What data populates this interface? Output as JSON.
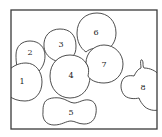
{
  "diagram": {
    "frame": {
      "x": 11,
      "y": 10,
      "width": 146,
      "height": 119
    },
    "regions": [
      {
        "id": "1",
        "label": "1",
        "label_pos": [
          22,
          82
        ]
      },
      {
        "id": "2",
        "label": "2",
        "label_pos": [
          30,
          53
        ]
      },
      {
        "id": "3",
        "label": "3",
        "label_pos": [
          61,
          45
        ]
      },
      {
        "id": "4",
        "label": "4",
        "label_pos": [
          71,
          76
        ]
      },
      {
        "id": "5",
        "label": "5",
        "label_pos": [
          71,
          113
        ]
      },
      {
        "id": "6",
        "label": "6",
        "label_pos": [
          96,
          33
        ]
      },
      {
        "id": "7",
        "label": "7",
        "label_pos": [
          104,
          65
        ]
      },
      {
        "id": "8",
        "label": "8",
        "label_pos": [
          143,
          88
        ]
      }
    ]
  }
}
